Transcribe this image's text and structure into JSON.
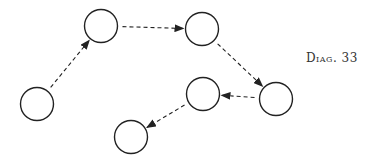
{
  "label": "Diag. 33",
  "style": {
    "stroke": "#222222",
    "fill": "#ffffff",
    "node_radius": 16.5
  },
  "nodes": [
    {
      "id": "A",
      "cx": 37,
      "cy": 104
    },
    {
      "id": "B",
      "cx": 101,
      "cy": 26
    },
    {
      "id": "C",
      "cx": 202,
      "cy": 29
    },
    {
      "id": "D",
      "cx": 276,
      "cy": 99
    },
    {
      "id": "E",
      "cx": 203,
      "cy": 94
    },
    {
      "id": "F",
      "cx": 131,
      "cy": 137
    }
  ],
  "edges": [
    {
      "from": "A",
      "to": "B",
      "style": "dashed",
      "arrow": "end"
    },
    {
      "from": "B",
      "to": "C",
      "style": "dashed",
      "arrow": "end"
    },
    {
      "from": "C",
      "to": "D",
      "style": "dashed",
      "arrow": "end"
    },
    {
      "from": "D",
      "to": "E",
      "style": "dashed",
      "arrow": "end"
    },
    {
      "from": "E",
      "to": "F",
      "style": "dashed",
      "arrow": "end"
    }
  ]
}
